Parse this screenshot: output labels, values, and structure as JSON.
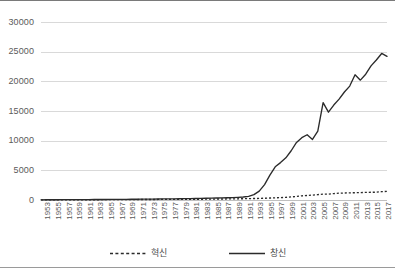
{
  "chart_data": {
    "type": "line",
    "title": "",
    "xlabel": "",
    "ylabel": "",
    "ylim": [
      0,
      30000
    ],
    "yticks": [
      0,
      5000,
      10000,
      15000,
      20000,
      25000,
      30000
    ],
    "ytick_labels": [
      "0",
      "5000",
      "10000",
      "15000",
      "20000",
      "25000",
      "30000"
    ],
    "grid": true,
    "legend_position": "bottom",
    "x_tick_step": 2,
    "x": [
      1953,
      1954,
      1955,
      1956,
      1957,
      1958,
      1959,
      1960,
      1961,
      1962,
      1963,
      1964,
      1965,
      1966,
      1967,
      1968,
      1969,
      1970,
      1971,
      1972,
      1973,
      1974,
      1975,
      1976,
      1977,
      1978,
      1979,
      1980,
      1981,
      1982,
      1983,
      1984,
      1985,
      1986,
      1987,
      1988,
      1989,
      1990,
      1991,
      1992,
      1993,
      1994,
      1995,
      1996,
      1997,
      1998,
      1999,
      2000,
      2001,
      2002,
      2003,
      2004,
      2005,
      2006,
      2007,
      2008,
      2009,
      2010,
      2011,
      2012,
      2013,
      2014,
      2015,
      2016,
      2017,
      2018
    ],
    "xtick_labels": [
      "1953",
      "1955",
      "1957",
      "1959",
      "1961",
      "1963",
      "1965",
      "1967",
      "1969",
      "1971",
      "1973",
      "1975",
      "1977",
      "1979",
      "1981",
      "1983",
      "1985",
      "1987",
      "1989",
      "1991",
      "1993",
      "1995",
      "1997",
      "1999",
      "2001",
      "2003",
      "2005",
      "2007",
      "2009",
      "2011",
      "2013",
      "2015",
      "2017"
    ],
    "series": [
      {
        "name": "혁신",
        "style": "dashed",
        "color": "#2b2b2b",
        "values": [
          20,
          22,
          25,
          28,
          30,
          32,
          35,
          38,
          40,
          45,
          48,
          50,
          55,
          58,
          60,
          65,
          70,
          72,
          75,
          80,
          85,
          88,
          92,
          95,
          100,
          105,
          110,
          115,
          120,
          125,
          130,
          140,
          150,
          160,
          170,
          180,
          190,
          200,
          215,
          230,
          250,
          270,
          300,
          330,
          360,
          400,
          450,
          520,
          600,
          700,
          760,
          830,
          900,
          1000,
          980,
          1080,
          1150,
          1180,
          1200,
          1230,
          1250,
          1280,
          1300,
          1320,
          1400,
          1450
        ]
      },
      {
        "name": "창신",
        "style": "solid",
        "color": "#2b2b2b",
        "values": [
          30,
          35,
          40,
          45,
          50,
          55,
          60,
          65,
          70,
          75,
          80,
          85,
          90,
          95,
          100,
          110,
          115,
          120,
          130,
          140,
          150,
          160,
          170,
          180,
          190,
          200,
          210,
          225,
          240,
          255,
          270,
          290,
          310,
          330,
          350,
          380,
          410,
          450,
          500,
          620,
          900,
          1500,
          2600,
          4200,
          5600,
          6300,
          7100,
          8300,
          9700,
          10500,
          11000,
          10200,
          11600,
          16400,
          14800,
          16000,
          17000,
          18200,
          19200,
          21100,
          20200,
          21200,
          22600,
          23600,
          24700,
          24200
        ]
      }
    ],
    "annotations": []
  },
  "legend": {
    "items": [
      {
        "label": "혁신",
        "style": "dashed"
      },
      {
        "label": "창신",
        "style": "solid"
      }
    ]
  }
}
